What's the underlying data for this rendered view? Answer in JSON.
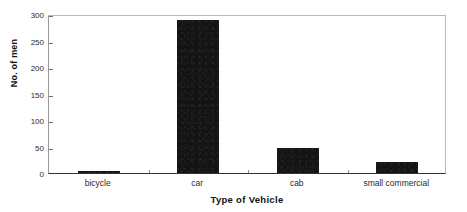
{
  "chart_data": {
    "type": "bar",
    "title": "",
    "xlabel": "Type of Vehicle",
    "ylabel": "No. of men",
    "categories": [
      "bicycle",
      "car",
      "cab",
      "small commercial"
    ],
    "values": [
      3,
      289,
      47,
      20
    ],
    "ylim": [
      0,
      300
    ],
    "ytick_labels": [
      "0",
      "50",
      "100",
      "150",
      "200",
      "250",
      "300"
    ],
    "ytick_values": [
      0,
      50,
      100,
      150,
      200,
      250,
      300
    ],
    "grid": false,
    "legend": null,
    "bar_color": "#141414",
    "axis_color": "#333333",
    "background_color": "#ffffff"
  }
}
